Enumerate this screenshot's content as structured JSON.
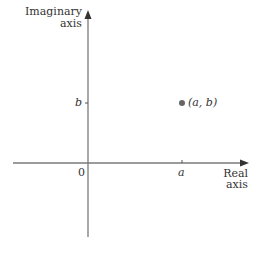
{
  "diagram": {
    "y_axis_label_line1": "Imaginary",
    "y_axis_label_line2": "axis",
    "x_axis_label_line1": "Real",
    "x_axis_label_line2": "axis",
    "origin_label": "0",
    "x_tick_label": "a",
    "y_tick_label": "b",
    "point_label": "(a, b)",
    "colors": {
      "axis": "#7a7a7a",
      "point": "#666666",
      "text": "#333333"
    }
  }
}
